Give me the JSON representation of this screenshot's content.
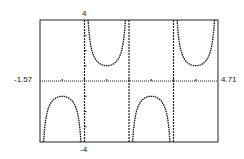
{
  "chart_data": {
    "type": "line",
    "title": "",
    "function": "y = csc(2x)",
    "xlabel": "",
    "ylabel": "",
    "xlim": [
      -1.57,
      4.71
    ],
    "ylim": [
      -4,
      4
    ],
    "x_tick_step": 0.785,
    "y_tick_step": 1,
    "grid": false,
    "asymptotes_x": [
      0,
      1.57,
      3.14
    ],
    "axis_labels": {
      "xmin": "-1.57",
      "xmax": "4.71",
      "ymax": "4",
      "ymin": "-4"
    },
    "series": [
      {
        "name": "branch-1",
        "x": [
          -1.48,
          -1.2,
          -0.9,
          -0.785,
          -0.6,
          -0.3,
          -0.13
        ],
        "y": [
          -5.6,
          -1.48,
          -1.03,
          -1.0,
          -1.07,
          -1.77,
          -3.9
        ]
      },
      {
        "name": "branch-2",
        "x": [
          0.13,
          0.3,
          0.6,
          0.785,
          0.9,
          1.2,
          1.48
        ],
        "y": [
          3.9,
          1.77,
          1.07,
          1.0,
          1.03,
          1.48,
          5.6
        ]
      },
      {
        "name": "branch-3",
        "x": [
          1.7,
          1.9,
          2.2,
          2.356,
          2.5,
          2.8,
          3.0
        ],
        "y": [
          -3.9,
          -1.63,
          -1.05,
          -1.0,
          -1.04,
          -1.58,
          -3.6
        ]
      },
      {
        "name": "branch-4",
        "x": [
          3.27,
          3.45,
          3.7,
          3.927,
          4.1,
          4.4,
          4.62
        ],
        "y": [
          3.9,
          1.75,
          1.1,
          1.0,
          1.06,
          1.8,
          5.6
        ]
      }
    ]
  }
}
